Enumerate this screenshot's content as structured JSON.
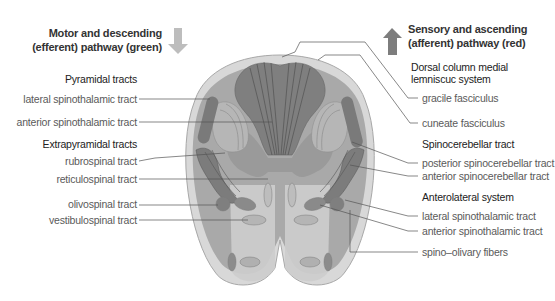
{
  "left": {
    "title_line1": "Motor and descending",
    "title_line2": "(efferent) pathway (green)",
    "arrow": "down-arrow-icon",
    "arrow_color": "#b8b8b8",
    "groups": [
      {
        "heading": "Pyramidal tracts",
        "items": [
          "lateral spinothalamic tract",
          "anterior spinothalamic tract"
        ]
      },
      {
        "heading": "Extrapyramidal tracts",
        "items": [
          "rubrospinal tract",
          "reticulospinal tract",
          "olivospinal tract",
          "vestibulospinal tract"
        ]
      }
    ]
  },
  "right": {
    "title_line1": "Sensory and ascending",
    "title_line2": "(afferent) pathway (red)",
    "arrow": "up-arrow-icon",
    "arrow_color": "#7a7a7a",
    "groups": [
      {
        "heading_line1": "Dorsal column medial",
        "heading_line2": "lemniscuc system",
        "items": [
          "gracile fasciculus",
          "cuneate fasciculus"
        ]
      },
      {
        "heading": "Spinocerebellar tract",
        "items": [
          "posterior spinocerebellar tract",
          "anterior spinocerebellar tract"
        ]
      },
      {
        "heading": "Anterolateral system",
        "items": [
          "lateral spinothalamic tract",
          "anterior spinothalamic tract",
          "spino–olivary fibers"
        ]
      }
    ]
  },
  "colors": {
    "dark_tract": "#7c7c7c",
    "mid_tract": "#999999",
    "light_tract": "#b4b4b4",
    "pale_region": "#cfcfcf",
    "outline": "#a0a0a0",
    "leader_line": "#555555"
  }
}
